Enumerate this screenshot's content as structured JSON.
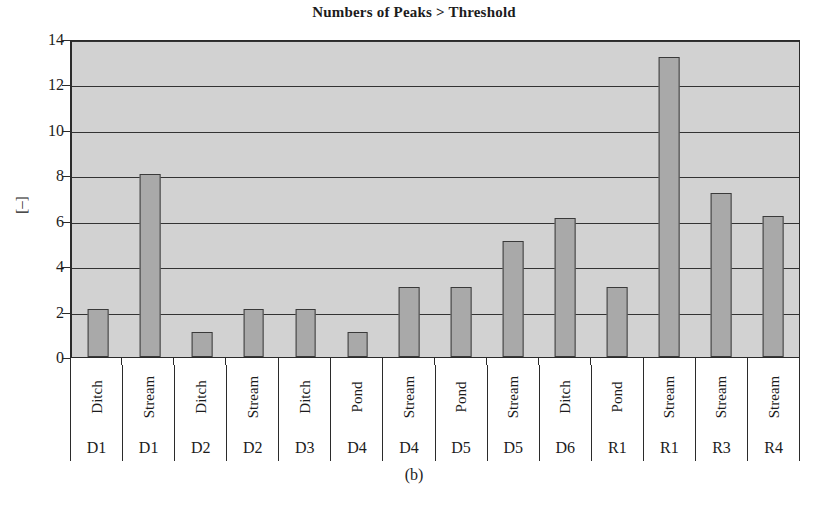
{
  "chart_data": {
    "type": "bar",
    "title": "Numbers of Peaks > Threshold",
    "subcaption": "(b)",
    "xlabel": "",
    "ylabel": "[–]",
    "ylim": [
      0,
      14
    ],
    "yticks": [
      0,
      2,
      4,
      6,
      8,
      10,
      12,
      14
    ],
    "grid": true,
    "legend": "none",
    "categories": [
      "D1 Ditch",
      "D1 Stream",
      "D2 Ditch",
      "D2 Stream",
      "D3 Ditch",
      "D4 Pond",
      "D4 Stream",
      "D5 Pond",
      "D5 Stream",
      "D6 Ditch",
      "R1 Pond",
      "R1 Stream",
      "R3 Stream",
      "R4 Stream"
    ],
    "category_types": [
      "Ditch",
      "Stream",
      "Ditch",
      "Stream",
      "Ditch",
      "Pond",
      "Stream",
      "Pond",
      "Stream",
      "Ditch",
      "Pond",
      "Stream",
      "Stream",
      "Stream"
    ],
    "category_sites": [
      "D1",
      "D1",
      "D2",
      "D2",
      "D3",
      "D4",
      "D4",
      "D5",
      "D5",
      "D6",
      "R1",
      "R1",
      "R3",
      "R4"
    ],
    "values": [
      2.1,
      8.05,
      1.1,
      2.1,
      2.1,
      1.1,
      3.1,
      3.1,
      5.1,
      6.1,
      3.1,
      13.2,
      7.2,
      6.2
    ],
    "bar_color": "#a9a9a9",
    "bar_edge_color": "#3a3a3a",
    "plot_background": "#d2d2d2",
    "gridline_color": "#333333",
    "axis_color": "#2b2b2b"
  }
}
